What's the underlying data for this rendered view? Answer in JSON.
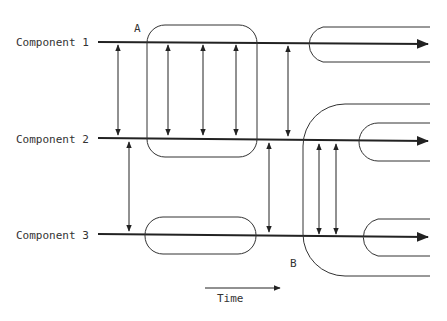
{
  "diagram": {
    "components": [
      {
        "label": "Component 1"
      },
      {
        "label": "Component 2"
      },
      {
        "label": "Component 3"
      }
    ],
    "markers": {
      "a": "A",
      "b": "B"
    },
    "time_label": "Time",
    "colors": {
      "stroke": "#222222",
      "background": "#ffffff"
    }
  }
}
